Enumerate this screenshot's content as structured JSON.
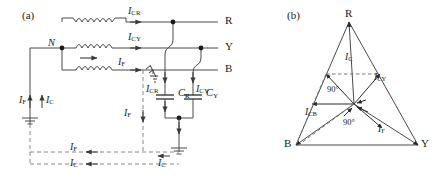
{
  "figure": {
    "panels": [
      {
        "tag": "(a)",
        "caption": "circuit diagram of earth-fault on B phase with phase-to-earth capacitances"
      },
      {
        "tag": "(b)",
        "caption": "phasor diagram of capacitive and fault currents"
      }
    ]
  },
  "circuit": {
    "panel_tag": "(a)",
    "neutral_label": "N",
    "terminals": [
      {
        "name": "R",
        "label": "R"
      },
      {
        "name": "Y",
        "label": "Y"
      },
      {
        "name": "B",
        "label": "B"
      }
    ],
    "windings": [
      {
        "name": "winding-r",
        "phase": "R"
      },
      {
        "name": "winding-y",
        "phase": "Y"
      },
      {
        "name": "winding-b",
        "phase": "B"
      }
    ],
    "currents": [
      {
        "id": "i-cr-line",
        "base": "I",
        "sub": "CR",
        "text": "ICR"
      },
      {
        "id": "i-cy-line",
        "base": "I",
        "sub": "CY",
        "text": "ICY"
      },
      {
        "id": "i-f-line",
        "base": "I",
        "sub": "F",
        "text": "IF"
      },
      {
        "id": "i-cr-cap",
        "base": "I",
        "sub": "CR",
        "text": "ICR"
      },
      {
        "id": "i-cy-cap",
        "base": "I",
        "sub": "CY",
        "text": "ICY"
      },
      {
        "id": "i-f-neutral",
        "base": "I",
        "sub": "F",
        "text": "IF"
      },
      {
        "id": "i-c-neutral",
        "base": "I",
        "sub": "C",
        "text": "IC"
      },
      {
        "id": "i-f-return",
        "base": "I",
        "sub": "F",
        "text": "IF"
      },
      {
        "id": "i-c-return",
        "base": "I",
        "sub": "C",
        "text": "IC"
      },
      {
        "id": "i-f-drop",
        "base": "I",
        "sub": "F",
        "text": "IF"
      },
      {
        "id": "i-c-ground",
        "base": "I",
        "sub": "C",
        "text": "IC"
      }
    ],
    "capacitors": [
      {
        "id": "cap-r",
        "base": "C",
        "sub": "R",
        "text": "CR"
      },
      {
        "id": "cap-y",
        "base": "C",
        "sub": "Y",
        "text": "CY"
      }
    ],
    "ground_symbols": [
      "fault-ground",
      "neutral-ground",
      "capacitor-ground"
    ],
    "fault_symbol": "earth-fault-arrester-b-phase"
  },
  "phasor": {
    "panel_tag": "(b)",
    "vertices": [
      {
        "name": "R",
        "label": "R"
      },
      {
        "name": "B",
        "label": "B"
      },
      {
        "name": "Y",
        "label": "Y"
      }
    ],
    "vectors": [
      {
        "id": "ph-i-c",
        "base": "I",
        "sub": "C",
        "text": "IC"
      },
      {
        "id": "ph-i-cy",
        "base": "I",
        "sub": "CY",
        "text": "ICY"
      },
      {
        "id": "ph-i-cb",
        "base": "I",
        "sub": "CB",
        "text": "ICB"
      },
      {
        "id": "ph-i-f",
        "base": "I",
        "sub": "F",
        "text": "IF"
      }
    ],
    "angles": [
      {
        "id": "angle-upper",
        "text": "90°"
      },
      {
        "id": "angle-lower",
        "text": "90°"
      }
    ]
  },
  "colors": {
    "ink": "#1a1a1a",
    "wire": "#4a4a4a",
    "dashed": "#777777",
    "background": "#ffffff"
  }
}
